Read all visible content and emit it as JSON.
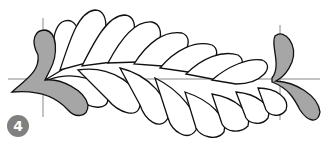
{
  "figure": {
    "step_number": "4",
    "colors": {
      "outline": "#111111",
      "fill_gray": "#a6a6a6",
      "guide": "#888888",
      "badge": "#808080"
    }
  }
}
